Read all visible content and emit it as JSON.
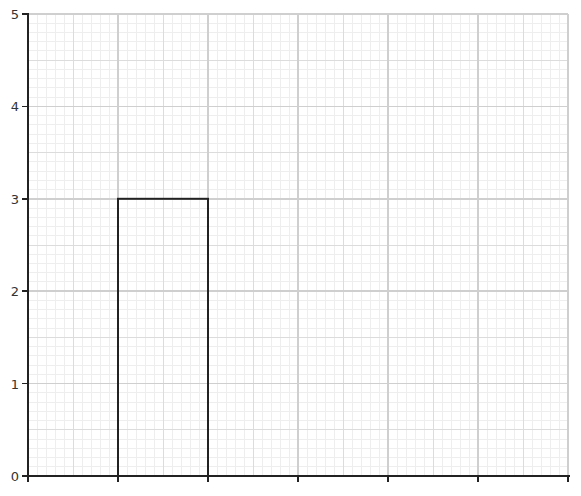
{
  "chart_data": {
    "type": "bar",
    "title": "",
    "xlabel": "",
    "ylabel": "",
    "categories": [
      "",
      "",
      "",
      "",
      "",
      ""
    ],
    "values": [
      0,
      3,
      0,
      0,
      0,
      0
    ],
    "ylim": [
      0,
      5
    ],
    "yticks": [
      0,
      1,
      2,
      3,
      4,
      5
    ],
    "grid": true,
    "legend": null,
    "bar_style": {
      "fill": "none",
      "stroke": "#222222"
    }
  },
  "layout": {
    "plot_left": 28,
    "plot_right": 568,
    "plot_top": 14,
    "plot_bottom": 476,
    "colors": {
      "axis": "#222222",
      "major_grid": "#cfcfcf",
      "medium_grid": "#dcdcdc",
      "minor_grid": "#eeeeee",
      "bar_stroke": "#222222"
    }
  }
}
